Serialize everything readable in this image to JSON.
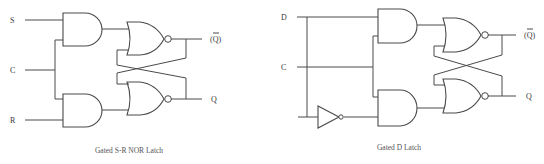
{
  "diagrams": [
    {
      "title": "Gated S-R NOR Latch",
      "inputs": [
        "S",
        "C",
        "R"
      ],
      "outputs": {
        "q_bar": "(Q)",
        "q": "Q"
      },
      "gates": [
        "AND",
        "AND",
        "NOR",
        "NOR"
      ]
    },
    {
      "title": "Gated D Latch",
      "inputs": [
        "D",
        "C"
      ],
      "outputs": {
        "q_bar": "(Q)",
        "q": "Q"
      },
      "gates": [
        "AND",
        "AND",
        "NOT",
        "NOR",
        "NOR"
      ]
    }
  ],
  "colors": {
    "line": "#4a4a4a",
    "text": "#3a3a3a",
    "caption": "#555555",
    "background": "#ffffff"
  }
}
